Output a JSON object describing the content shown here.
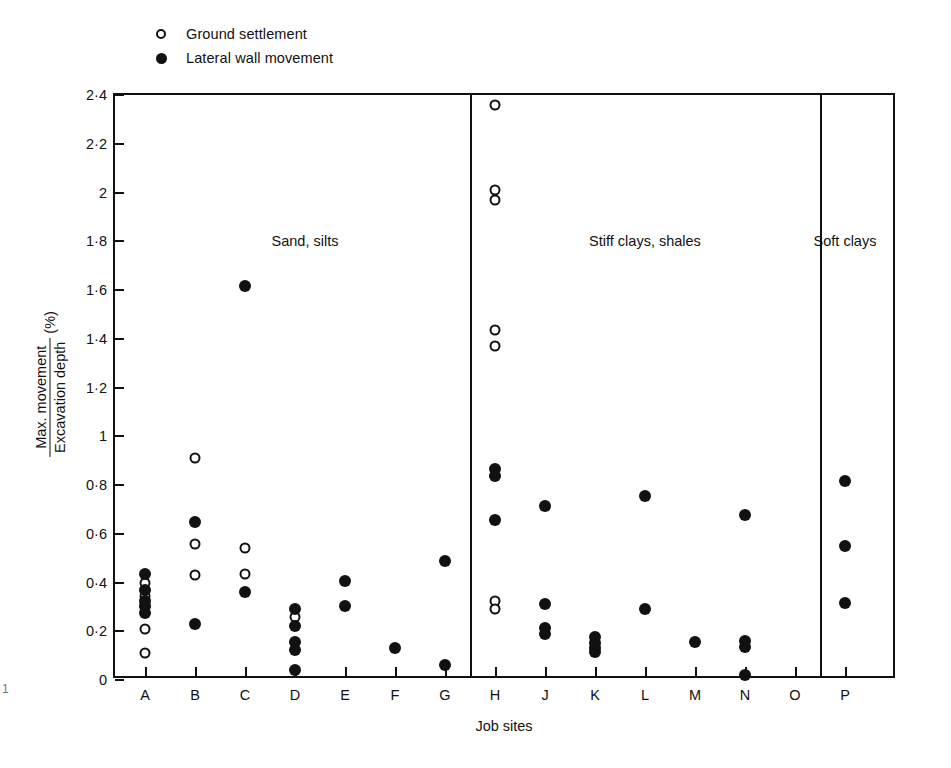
{
  "figure": {
    "page_marker": "1",
    "xlabel": "Job sites",
    "ylabel_numerator": "Max. movement",
    "ylabel_denominator": "Excavation depth",
    "ylabel_unit": "(%)"
  },
  "legend": {
    "position": "top-left",
    "items": [
      {
        "marker": "open-circle-icon",
        "label": "Ground settlement"
      },
      {
        "marker": "filled-circle-icon",
        "label": "Lateral wall movement"
      }
    ]
  },
  "axes": {
    "y_ticks": [
      "0",
      "0·2",
      "0·4",
      "0·6",
      "0·8",
      "1",
      "1·2",
      "1·4",
      "1·6",
      "1·8",
      "2",
      "2·2",
      "2·4"
    ],
    "y_tick_values": [
      0,
      0.2,
      0.4,
      0.6,
      0.8,
      1.0,
      1.2,
      1.4,
      1.6,
      1.8,
      2.0,
      2.2,
      2.4
    ],
    "x_ticks": [
      "A",
      "B",
      "C",
      "D",
      "E",
      "F",
      "G",
      "H",
      "J",
      "K",
      "L",
      "M",
      "N",
      "O",
      "P"
    ]
  },
  "groups": [
    {
      "label": "Sand, silts",
      "sites": [
        "A",
        "B",
        "C",
        "D",
        "E",
        "F",
        "G"
      ]
    },
    {
      "label": "Stiff clays, shales",
      "sites": [
        "H",
        "J",
        "K",
        "L",
        "M",
        "N",
        "O"
      ]
    },
    {
      "label": "Soft clays",
      "sites": [
        "P"
      ]
    }
  ],
  "chart_data": {
    "type": "scatter",
    "title": "",
    "xlabel": "Job sites",
    "ylabel": "Max. movement / Excavation depth (%)",
    "ylim": [
      0,
      2.4
    ],
    "grid": false,
    "legend_position": "top-left",
    "categories": [
      "A",
      "B",
      "C",
      "D",
      "E",
      "F",
      "G",
      "H",
      "J",
      "K",
      "L",
      "M",
      "N",
      "O",
      "P"
    ],
    "series": [
      {
        "name": "Ground settlement",
        "marker": "open-circle",
        "points": [
          {
            "site": "A",
            "value": 0.4
          },
          {
            "site": "A",
            "value": 0.345
          },
          {
            "site": "A",
            "value": 0.3
          },
          {
            "site": "A",
            "value": 0.21
          },
          {
            "site": "A",
            "value": 0.11
          },
          {
            "site": "B",
            "value": 0.91
          },
          {
            "site": "B",
            "value": 0.56
          },
          {
            "site": "B",
            "value": 0.43
          },
          {
            "site": "C",
            "value": 0.54
          },
          {
            "site": "C",
            "value": 0.435
          },
          {
            "site": "D",
            "value": 0.26
          },
          {
            "site": "H",
            "value": 2.36
          },
          {
            "site": "H",
            "value": 2.01
          },
          {
            "site": "H",
            "value": 1.97
          },
          {
            "site": "H",
            "value": 1.435
          },
          {
            "site": "H",
            "value": 1.37
          },
          {
            "site": "H",
            "value": 0.325
          },
          {
            "site": "H",
            "value": 0.29
          }
        ]
      },
      {
        "name": "Lateral wall movement",
        "marker": "filled-circle",
        "points": [
          {
            "site": "A",
            "value": 0.435
          },
          {
            "site": "A",
            "value": 0.37
          },
          {
            "site": "A",
            "value": 0.325
          },
          {
            "site": "A",
            "value": 0.305
          },
          {
            "site": "A",
            "value": 0.275
          },
          {
            "site": "B",
            "value": 0.65
          },
          {
            "site": "B",
            "value": 0.23
          },
          {
            "site": "C",
            "value": 1.615
          },
          {
            "site": "C",
            "value": 0.36
          },
          {
            "site": "D",
            "value": 0.29
          },
          {
            "site": "D",
            "value": 0.22
          },
          {
            "site": "D",
            "value": 0.155
          },
          {
            "site": "D",
            "value": 0.125
          },
          {
            "site": "D",
            "value": 0.04
          },
          {
            "site": "E",
            "value": 0.405
          },
          {
            "site": "E",
            "value": 0.305
          },
          {
            "site": "F",
            "value": 0.13
          },
          {
            "site": "G",
            "value": 0.49
          },
          {
            "site": "G",
            "value": 0.06
          },
          {
            "site": "H",
            "value": 0.865
          },
          {
            "site": "H",
            "value": 0.835
          },
          {
            "site": "H",
            "value": 0.655
          },
          {
            "site": "J",
            "value": 0.715
          },
          {
            "site": "J",
            "value": 0.31
          },
          {
            "site": "J",
            "value": 0.215
          },
          {
            "site": "J",
            "value": 0.19
          },
          {
            "site": "K",
            "value": 0.175
          },
          {
            "site": "K",
            "value": 0.15
          },
          {
            "site": "K",
            "value": 0.13
          },
          {
            "site": "K",
            "value": 0.115
          },
          {
            "site": "L",
            "value": 0.755
          },
          {
            "site": "L",
            "value": 0.29
          },
          {
            "site": "M",
            "value": 0.155
          },
          {
            "site": "N",
            "value": 0.675
          },
          {
            "site": "N",
            "value": 0.16
          },
          {
            "site": "N",
            "value": 0.135
          },
          {
            "site": "N",
            "value": 0.02
          },
          {
            "site": "P",
            "value": 0.815
          },
          {
            "site": "P",
            "value": 0.55
          },
          {
            "site": "P",
            "value": 0.315
          }
        ]
      }
    ]
  }
}
